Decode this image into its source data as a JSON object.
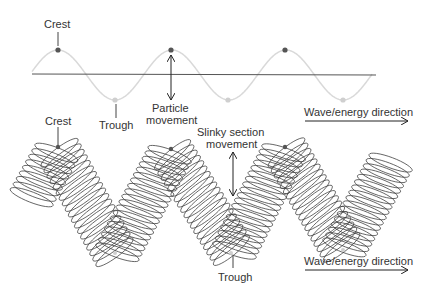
{
  "diagram": {
    "colors": {
      "background": "#ffffff",
      "baseline": "#555555",
      "wave_curve": "#d9d9d9",
      "crest_dot": "#555555",
      "trough_dot": "#cfcfcf",
      "coil_stroke": "#3a3a3a",
      "text": "#333333",
      "arrow": "#222222"
    },
    "top_wave": {
      "labels": {
        "crest": "Crest",
        "trough": "Trough",
        "particle_movement_line1": "Particle",
        "particle_movement_line2": "movement",
        "direction": "Wave/energy direction"
      },
      "crest_points": [
        [
          58,
          50
        ],
        [
          171,
          50
        ],
        [
          285,
          50
        ]
      ],
      "trough_points": [
        [
          115,
          100
        ],
        [
          228,
          100
        ],
        [
          343,
          100
        ]
      ]
    },
    "slinky": {
      "labels": {
        "crest": "Crest",
        "trough": "Trough",
        "section_movement_line1": "Slinky section",
        "section_movement_line2": "movement",
        "direction": "Wave/energy direction"
      },
      "zigzag_points": [
        [
          30,
          200
        ],
        [
          58,
          150
        ],
        [
          116,
          255
        ],
        [
          171,
          152
        ],
        [
          233,
          253
        ],
        [
          285,
          150
        ],
        [
          343,
          250
        ],
        [
          392,
          160
        ]
      ]
    }
  }
}
